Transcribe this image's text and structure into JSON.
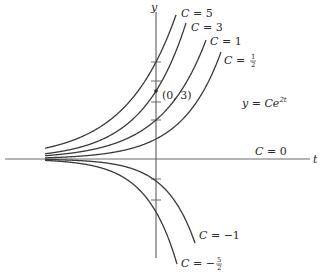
{
  "chart_data": {
    "type": "line",
    "title": "",
    "equation_label": "y = Ce^{2t}",
    "equation": {
      "lhs": "y",
      "rhs_base": "Ce",
      "rhs_exp": "2t"
    },
    "xlabel": "t",
    "ylabel": "y",
    "point_label": "(0, 3)",
    "point": [
      0,
      3
    ],
    "grid": false,
    "legend": "inline labels",
    "series": [
      {
        "name": "C = 5",
        "C": 5,
        "label_text": "C = 5"
      },
      {
        "name": "C = 3",
        "C": 3,
        "label_text": "C = 3"
      },
      {
        "name": "C = 1",
        "C": 1,
        "label_text": "C = 1"
      },
      {
        "name": "C = 1/2",
        "C": 0.5,
        "label_text": "C = 1/2"
      },
      {
        "name": "C = 0",
        "C": 0,
        "label_text": "C = 0"
      },
      {
        "name": "C = -1",
        "C": -1,
        "label_text": "C = −1"
      },
      {
        "name": "C = -5/2",
        "C": -2.5,
        "label_text": "C = −5/2"
      }
    ]
  },
  "render": {
    "origin": [
      156,
      159
    ],
    "axis_color": "#6b6b6b",
    "curve_color": "#3a3a3a",
    "t_axis": {
      "x1": 5,
      "x2": 310
    },
    "y_axis": {
      "y1": 12,
      "y2": 258
    },
    "y_ticks_px": [
      62,
      81,
      102,
      120,
      179,
      200
    ],
    "curves": [
      {
        "a": 97,
        "b": 0.0198,
        "x_end": 176
      },
      {
        "a": 68,
        "b": 0.0231,
        "x_end": 186
      },
      {
        "a": 39,
        "b": 0.0223,
        "x_end": 206
      },
      {
        "a": 20,
        "b": 0.0258,
        "x_end": 221
      },
      {
        "a": -22,
        "b": 0.0344,
        "x_end": 195
      },
      {
        "a": -53,
        "b": 0.0326,
        "x_end": 177
      }
    ],
    "x_start": 45
  },
  "labels": {
    "y_axis": "y",
    "t_axis": "t",
    "c5_C": "C",
    "c5_rest": " = 5",
    "c3_C": "C",
    "c3_rest": " = 3",
    "c1_C": "C",
    "c1_rest": " = 1",
    "chalf_C": "C",
    "chalf_eq": " = ",
    "chalf_num": "1",
    "chalf_den": "2",
    "c0_C": "C",
    "c0_rest": " = 0",
    "cm1_C": "C",
    "cm1_rest": " = −1",
    "cm52_C": "C",
    "cm52_eq": " = −",
    "cm52_num": "5",
    "cm52_den": "2",
    "point": "(0, 3)",
    "eq_y": "y",
    "eq_mid": " = ",
    "eq_C": "Ce",
    "eq_exp": "2t"
  }
}
